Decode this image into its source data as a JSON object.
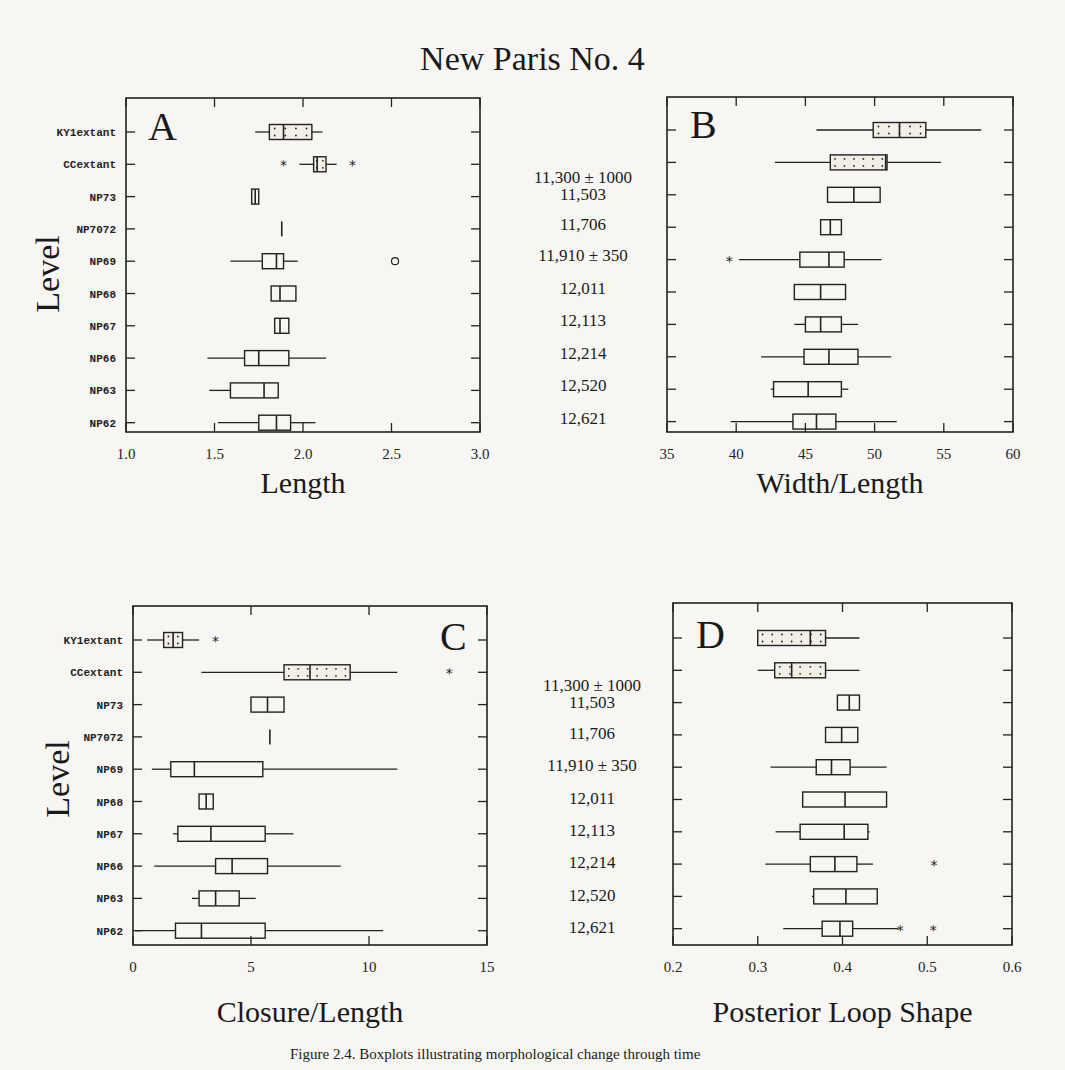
{
  "title": "New Paris No. 4",
  "y_axis_label": "Level",
  "levels": [
    "KY1extant",
    "CCextant",
    "NP73",
    "NP7072",
    "NP69",
    "NP68",
    "NP67",
    "NP66",
    "NP63",
    "NP62"
  ],
  "dates_top": [
    "11,300 ± 1000",
    "11,503",
    "11,706",
    "11,910 ± 350",
    "12,011",
    "12,113",
    "12,214",
    "12,520",
    "12,621"
  ],
  "dates_bottom": [
    "11,300 ± 1000",
    "11,503",
    "11,706",
    "11,910 ± 350",
    "12,011",
    "12,113",
    "12,214",
    "12,520",
    "12,621"
  ],
  "caption": "Figure 2.4. Boxplots illustrating morphological change through time",
  "chart_data": [
    {
      "type": "boxplot",
      "panel": "A",
      "title": "A",
      "xlabel": "Length",
      "ylabel": "Level",
      "xlim": [
        1.0,
        3.0
      ],
      "xticks": [
        "1.0",
        "1.5",
        "2.0",
        "2.5",
        "3.0"
      ],
      "categories": [
        "KY1extant",
        "CCextant",
        "NP73",
        "NP7072",
        "NP69",
        "NP68",
        "NP67",
        "NP66",
        "NP63",
        "NP62"
      ],
      "boxes": [
        {
          "min": 1.73,
          "q1": 1.81,
          "median": 1.89,
          "q3": 2.05,
          "max": 2.11,
          "dotted": true,
          "outliers": []
        },
        {
          "min": 1.98,
          "q1": 2.06,
          "median": 2.08,
          "q3": 2.13,
          "max": 2.19,
          "dotted": true,
          "outliers": [
            {
              "x": 1.89,
              "s": "*"
            },
            {
              "x": 2.28,
              "s": "*"
            }
          ]
        },
        {
          "min": 1.71,
          "q1": 1.71,
          "median": 1.73,
          "q3": 1.75,
          "max": 1.75,
          "dotted": false,
          "outliers": []
        },
        {
          "min": 1.88,
          "q1": 1.88,
          "median": 1.88,
          "q3": 1.88,
          "max": 1.88,
          "dotted": false,
          "outliers": []
        },
        {
          "min": 1.59,
          "q1": 1.77,
          "median": 1.85,
          "q3": 1.89,
          "max": 1.97,
          "dotted": false,
          "outliers": [
            {
              "x": 2.52,
              "s": "o"
            }
          ]
        },
        {
          "min": 1.82,
          "q1": 1.82,
          "median": 1.87,
          "q3": 1.96,
          "max": 1.96,
          "dotted": false,
          "outliers": []
        },
        {
          "min": 1.84,
          "q1": 1.84,
          "median": 1.87,
          "q3": 1.92,
          "max": 1.92,
          "dotted": false,
          "outliers": []
        },
        {
          "min": 1.46,
          "q1": 1.67,
          "median": 1.75,
          "q3": 1.92,
          "max": 2.13,
          "dotted": false,
          "outliers": []
        },
        {
          "min": 1.47,
          "q1": 1.59,
          "median": 1.78,
          "q3": 1.86,
          "max": 1.86,
          "dotted": false,
          "outliers": []
        },
        {
          "min": 1.52,
          "q1": 1.75,
          "median": 1.85,
          "q3": 1.93,
          "max": 2.07,
          "dotted": false,
          "outliers": []
        }
      ]
    },
    {
      "type": "boxplot",
      "panel": "B",
      "title": "B",
      "xlabel": "Width/Length",
      "ylabel": "",
      "xlim": [
        35,
        60
      ],
      "xticks": [
        "35",
        "40",
        "45",
        "50",
        "55",
        "60"
      ],
      "categories": [
        "KY1extant",
        "CCextant",
        "NP73",
        "NP7072",
        "NP69",
        "NP68",
        "NP67",
        "NP66",
        "NP63",
        "NP62"
      ],
      "boxes": [
        {
          "min": 45.8,
          "q1": 49.9,
          "median": 51.8,
          "q3": 53.7,
          "max": 57.7,
          "dotted": true,
          "outliers": []
        },
        {
          "min": 42.8,
          "q1": 46.8,
          "median": 50.8,
          "q3": 50.9,
          "max": 54.8,
          "dotted": true,
          "outliers": []
        },
        {
          "min": 46.6,
          "q1": 46.6,
          "median": 48.5,
          "q3": 50.4,
          "max": 50.4,
          "dotted": false,
          "outliers": []
        },
        {
          "min": 46.1,
          "q1": 46.1,
          "median": 46.8,
          "q3": 47.6,
          "max": 47.6,
          "dotted": false,
          "outliers": []
        },
        {
          "min": 40.2,
          "q1": 44.6,
          "median": 46.7,
          "q3": 47.8,
          "max": 50.5,
          "dotted": false,
          "outliers": [
            {
              "x": 39.5,
              "s": "*"
            }
          ]
        },
        {
          "min": 44.2,
          "q1": 44.2,
          "median": 46.1,
          "q3": 47.9,
          "max": 47.9,
          "dotted": false,
          "outliers": []
        },
        {
          "min": 44.2,
          "q1": 45.0,
          "median": 46.1,
          "q3": 47.6,
          "max": 48.8,
          "dotted": false,
          "outliers": []
        },
        {
          "min": 41.8,
          "q1": 44.9,
          "median": 46.7,
          "q3": 48.8,
          "max": 51.2,
          "dotted": false,
          "outliers": []
        },
        {
          "min": 42.5,
          "q1": 42.7,
          "median": 45.2,
          "q3": 47.6,
          "max": 48.1,
          "dotted": false,
          "outliers": []
        },
        {
          "min": 39.6,
          "q1": 44.1,
          "median": 45.8,
          "q3": 47.2,
          "max": 51.6,
          "dotted": false,
          "outliers": []
        }
      ]
    },
    {
      "type": "boxplot",
      "panel": "C",
      "title": "C",
      "xlabel": "Closure/Length",
      "ylabel": "Level",
      "xlim": [
        0,
        15
      ],
      "xticks": [
        "0",
        "5",
        "10",
        "15"
      ],
      "categories": [
        "KY1extant",
        "CCextant",
        "NP73",
        "NP7072",
        "NP69",
        "NP68",
        "NP67",
        "NP66",
        "NP63",
        "NP62"
      ],
      "boxes": [
        {
          "min": 0.6,
          "q1": 1.3,
          "median": 1.7,
          "q3": 2.1,
          "max": 2.8,
          "dotted": true,
          "outliers": [
            {
              "x": 3.5,
              "s": "*"
            }
          ]
        },
        {
          "min": 2.9,
          "q1": 6.4,
          "median": 7.5,
          "q3": 9.2,
          "max": 11.2,
          "dotted": true,
          "outliers": [
            {
              "x": 13.4,
              "s": "*"
            }
          ]
        },
        {
          "min": 5.0,
          "q1": 5.0,
          "median": 5.7,
          "q3": 6.4,
          "max": 6.4,
          "dotted": false,
          "outliers": []
        },
        {
          "min": 5.8,
          "q1": 5.8,
          "median": 5.8,
          "q3": 5.8,
          "max": 5.8,
          "dotted": false,
          "outliers": []
        },
        {
          "min": 0.8,
          "q1": 1.6,
          "median": 2.6,
          "q3": 5.5,
          "max": 11.2,
          "dotted": false,
          "outliers": []
        },
        {
          "min": 2.8,
          "q1": 2.8,
          "median": 3.1,
          "q3": 3.4,
          "max": 3.4,
          "dotted": false,
          "outliers": []
        },
        {
          "min": 1.7,
          "q1": 1.9,
          "median": 3.3,
          "q3": 5.6,
          "max": 6.8,
          "dotted": false,
          "outliers": []
        },
        {
          "min": 0.9,
          "q1": 3.5,
          "median": 4.2,
          "q3": 5.7,
          "max": 8.8,
          "dotted": false,
          "outliers": []
        },
        {
          "min": 2.5,
          "q1": 2.8,
          "median": 3.5,
          "q3": 4.5,
          "max": 5.2,
          "dotted": false,
          "outliers": []
        },
        {
          "min": 0.1,
          "q1": 1.8,
          "median": 2.9,
          "q3": 5.6,
          "max": 10.6,
          "dotted": false,
          "outliers": []
        }
      ]
    },
    {
      "type": "boxplot",
      "panel": "D",
      "title": "D",
      "xlabel": "Posterior Loop Shape",
      "ylabel": "",
      "xlim": [
        0.2,
        0.6
      ],
      "xticks": [
        "0.2",
        "0.3",
        "0.4",
        "0.5",
        "0.6"
      ],
      "categories": [
        "KY1extant",
        "CCextant",
        "NP73",
        "NP7072",
        "NP69",
        "NP68",
        "NP67",
        "NP66",
        "NP63",
        "NP62"
      ],
      "boxes": [
        {
          "min": 0.3,
          "q1": 0.3,
          "median": 0.362,
          "q3": 0.38,
          "max": 0.42,
          "dotted": true,
          "outliers": []
        },
        {
          "min": 0.3,
          "q1": 0.32,
          "median": 0.34,
          "q3": 0.38,
          "max": 0.42,
          "dotted": true,
          "outliers": []
        },
        {
          "min": 0.394,
          "q1": 0.394,
          "median": 0.408,
          "q3": 0.42,
          "max": 0.42,
          "dotted": false,
          "outliers": []
        },
        {
          "min": 0.38,
          "q1": 0.38,
          "median": 0.399,
          "q3": 0.418,
          "max": 0.418,
          "dotted": false,
          "outliers": []
        },
        {
          "min": 0.315,
          "q1": 0.369,
          "median": 0.387,
          "q3": 0.409,
          "max": 0.452,
          "dotted": false,
          "outliers": []
        },
        {
          "min": 0.353,
          "q1": 0.353,
          "median": 0.403,
          "q3": 0.452,
          "max": 0.452,
          "dotted": false,
          "outliers": []
        },
        {
          "min": 0.321,
          "q1": 0.35,
          "median": 0.402,
          "q3": 0.43,
          "max": 0.432,
          "dotted": false,
          "outliers": []
        },
        {
          "min": 0.309,
          "q1": 0.362,
          "median": 0.391,
          "q3": 0.417,
          "max": 0.436,
          "dotted": false,
          "outliers": [
            {
              "x": 0.508,
              "s": "*"
            }
          ]
        },
        {
          "min": 0.364,
          "q1": 0.366,
          "median": 0.404,
          "q3": 0.441,
          "max": 0.441,
          "dotted": false,
          "outliers": []
        },
        {
          "min": 0.33,
          "q1": 0.376,
          "median": 0.397,
          "q3": 0.412,
          "max": 0.466,
          "dotted": false,
          "outliers": [
            {
              "x": 0.468,
              "s": "*"
            },
            {
              "x": 0.507,
              "s": "*"
            }
          ]
        }
      ]
    }
  ]
}
